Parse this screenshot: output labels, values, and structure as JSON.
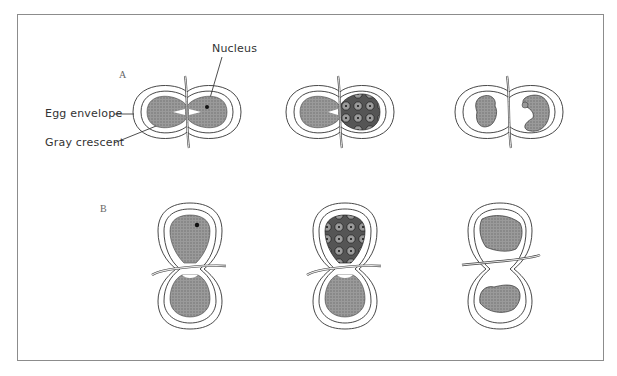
{
  "figure": {
    "rows": [
      {
        "label": "A",
        "orientation": "horizontal",
        "stages": [
          "ligated egg with nucleus on one side",
          "nucleated half cleaving",
          "two embryos formed"
        ]
      },
      {
        "label": "B",
        "orientation": "vertical",
        "stages": [
          "ligated egg with nucleus in upper half",
          "upper half cleaving",
          "upper half abnormal, lower half embryo"
        ]
      }
    ],
    "annotations": {
      "nucleus": "Nucleus",
      "egg_envelope": "Egg envelope",
      "gray_crescent": "Gray crescent"
    },
    "colors": {
      "frame": "#8c8c8c",
      "stipple": "#8a8a8a",
      "outline": "#333333",
      "background": "#ffffff"
    }
  }
}
